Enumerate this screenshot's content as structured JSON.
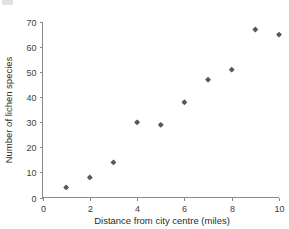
{
  "chart_data": {
    "type": "scatter",
    "title": "",
    "xlabel": "Distance from city centre (miles)",
    "ylabel": "Number of lichen species",
    "xlim": [
      0,
      10
    ],
    "ylim": [
      0,
      70
    ],
    "grid": false,
    "legend": "none",
    "marker_color": "#595959",
    "axis_color": "#8a8a8a",
    "x": [
      1,
      2,
      3,
      4,
      5,
      6,
      7,
      8,
      9,
      10
    ],
    "values": [
      4,
      8,
      14,
      30,
      29,
      38,
      47,
      51,
      67,
      65
    ],
    "points": [
      {
        "x": 1,
        "y": 4
      },
      {
        "x": 2,
        "y": 8
      },
      {
        "x": 3,
        "y": 14
      },
      {
        "x": 4,
        "y": 30
      },
      {
        "x": 5,
        "y": 29
      },
      {
        "x": 6,
        "y": 38
      },
      {
        "x": 7,
        "y": 47
      },
      {
        "x": 8,
        "y": 51
      },
      {
        "x": 9,
        "y": 67
      },
      {
        "x": 10,
        "y": 65
      }
    ],
    "x_ticks": [
      {
        "value": 0,
        "label": "0"
      },
      {
        "value": 2,
        "label": "2"
      },
      {
        "value": 4,
        "label": "4"
      },
      {
        "value": 6,
        "label": "6"
      },
      {
        "value": 8,
        "label": "8"
      },
      {
        "value": 10,
        "label": "10"
      }
    ],
    "y_ticks": [
      {
        "value": 0,
        "label": "0"
      },
      {
        "value": 10,
        "label": "10"
      },
      {
        "value": 20,
        "label": "20"
      },
      {
        "value": 30,
        "label": "30"
      },
      {
        "value": 40,
        "label": "40"
      },
      {
        "value": 50,
        "label": "50"
      },
      {
        "value": 60,
        "label": "60"
      },
      {
        "value": 70,
        "label": "70"
      }
    ]
  }
}
